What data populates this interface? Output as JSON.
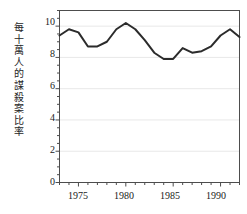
{
  "chart_data": {
    "type": "line",
    "title": "",
    "xlabel": "",
    "ylabel": "每十萬人的謀殺案比率",
    "xlim": [
      1973,
      1992
    ],
    "ylim": [
      0,
      11
    ],
    "grid": true,
    "legend": "none",
    "y_ticks": [
      0,
      2,
      4,
      6,
      8,
      10
    ],
    "y_tick_labels": [
      "0",
      "2",
      "4",
      "6",
      "8",
      "10"
    ],
    "y_minor_tick_step": 0.5,
    "x_ticks": [
      1975,
      1980,
      1985,
      1990
    ],
    "x_tick_labels": [
      "1975",
      "1980",
      "1985",
      "1990"
    ],
    "x_minor_tick_step": 1,
    "line_color": "#2b2b2b",
    "line_width": 2,
    "x": [
      1973,
      1974,
      1975,
      1976,
      1977,
      1978,
      1979,
      1980,
      1981,
      1982,
      1983,
      1984,
      1985,
      1986,
      1987,
      1988,
      1989,
      1990,
      1991,
      1992
    ],
    "values": [
      9.4,
      9.8,
      9.6,
      8.7,
      8.7,
      9.0,
      9.8,
      10.2,
      9.8,
      9.1,
      8.3,
      7.9,
      7.9,
      8.6,
      8.3,
      8.4,
      8.7,
      9.4,
      9.8,
      9.3
    ],
    "series": [
      {
        "name": "每十萬人的謀殺案比率",
        "values": [
          9.4,
          9.8,
          9.6,
          8.7,
          8.7,
          9.0,
          9.8,
          10.2,
          9.8,
          9.1,
          8.3,
          7.9,
          7.9,
          8.6,
          8.3,
          8.4,
          8.7,
          9.4,
          9.8,
          9.3
        ]
      }
    ]
  },
  "figure": {
    "background": "#ffffff",
    "frame_color": "#4d4d4d",
    "gridline_color": "#e8e8e8"
  }
}
